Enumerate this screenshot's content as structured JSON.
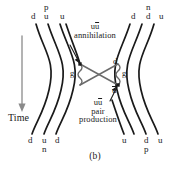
{
  "figure": {
    "caption": "(b)",
    "time_axis_label": "Time",
    "time_axis_direction": "downward"
  },
  "annotations": {
    "annihilation": {
      "line1_u": "u",
      "line1_ubar": "u",
      "line2": "annihilation"
    },
    "pair_production": {
      "line1_u": "u",
      "line1_ubar": "u",
      "line2": "pair",
      "line3": "production"
    }
  },
  "gluons": {
    "left_label": "g",
    "right_label": "g"
  },
  "exchange_quarks": {
    "top_label": "d",
    "bottom_label": "u"
  },
  "top_labels": {
    "left": [
      {
        "quark": "d"
      },
      {
        "hadron": "p",
        "quark": "u"
      },
      {
        "quark": "u"
      }
    ],
    "right": [
      {
        "quark": "d"
      },
      {
        "hadron": "n",
        "quark": "d"
      },
      {
        "quark": "u"
      }
    ]
  },
  "bottom_labels": {
    "left": [
      {
        "quark": "d"
      },
      {
        "quark": "u",
        "hadron": "n"
      },
      {
        "quark": "d"
      }
    ],
    "right": [
      {
        "quark": "u"
      },
      {
        "quark": "d",
        "hadron": "p"
      },
      {
        "quark": "u"
      }
    ]
  },
  "colors": {
    "line": "#1a1a1a",
    "gluon": "#6b6b6b",
    "arrow": "#8a8a8a",
    "background": "#ffffff"
  }
}
